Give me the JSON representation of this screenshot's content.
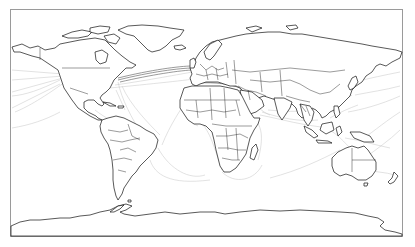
{
  "map": {
    "type": "world-map",
    "projection": "equirectangular",
    "subject": "submarine cable routes with country borders",
    "colors": {
      "background": "#ffffff",
      "frame": "#9a9a9a",
      "coastline": "#111111",
      "country_border": "#222222",
      "cable": "#c4c4c4",
      "cable_dense": "#555555"
    },
    "frame": {
      "x": 10,
      "y": 9,
      "width": 393,
      "height": 228
    },
    "regions": [
      "North America",
      "Greenland",
      "South America",
      "Europe",
      "Africa",
      "Asia",
      "Australia",
      "New Zealand",
      "Antarctica",
      "Indonesia",
      "Japan",
      "Madagascar"
    ]
  }
}
